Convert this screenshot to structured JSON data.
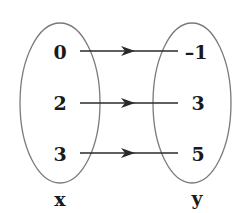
{
  "diagram": {
    "type": "mapping",
    "domain_set": {
      "label": "x",
      "values": [
        "0",
        "2",
        "3"
      ]
    },
    "range_set": {
      "label": "y",
      "values": [
        "–1",
        "3",
        "5"
      ]
    },
    "mappings": [
      {
        "from": "0",
        "to": "–1"
      },
      {
        "from": "2",
        "to": "3"
      },
      {
        "from": "3",
        "to": "5"
      }
    ],
    "colors": {
      "ellipse_stroke": "#7a7a7a",
      "text": "#1a1a1a",
      "arrow": "#2a2a2a"
    }
  }
}
